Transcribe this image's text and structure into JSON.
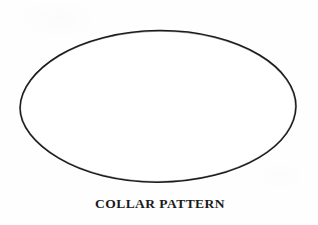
{
  "document": {
    "type": "scanned-line-drawing",
    "background_color": "#fefefe",
    "width": 318,
    "height": 225
  },
  "figure": {
    "shape_name": "ellipse",
    "icon_name": "ellipse-outline-icon",
    "stroke_color": "#1a1a1a",
    "fill_color": "#ffffff",
    "stroke_width": 1.5,
    "center_x": 158,
    "center_y": 106,
    "radius_x": 138,
    "radius_y": 76
  },
  "caption": {
    "text": "COLLAR PATTERN",
    "color": "#1b1b1b",
    "font_size_px": 13.5,
    "weight": "bold",
    "align": "center"
  }
}
